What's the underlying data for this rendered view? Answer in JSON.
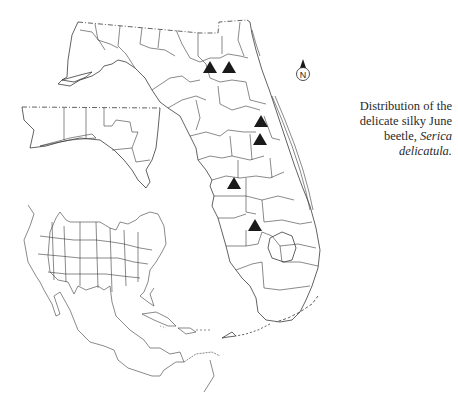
{
  "figure": {
    "caption": {
      "line1": "Distribution of the",
      "line2": "delicate silky June",
      "line3_plain": "beetle, ",
      "line3_italic": "Serica",
      "line4_italic": "delicatula."
    },
    "north_arrow": {
      "label": "N"
    },
    "marker": {
      "shape": "filled-triangle",
      "color": "#1a1a1a"
    },
    "records": [
      {
        "id": 1,
        "x": 210,
        "y": 68
      },
      {
        "id": 2,
        "x": 229,
        "y": 68
      },
      {
        "id": 3,
        "x": 261,
        "y": 122
      },
      {
        "id": 4,
        "x": 260,
        "y": 140
      },
      {
        "id": 5,
        "x": 234,
        "y": 184
      },
      {
        "id": 6,
        "x": 255,
        "y": 226
      }
    ],
    "insets": [
      {
        "name": "florida-panhandle-west-inset"
      },
      {
        "name": "north-america-locator-inset"
      }
    ],
    "colors": {
      "line": "#3a3a3a",
      "background": "#ffffff"
    }
  }
}
